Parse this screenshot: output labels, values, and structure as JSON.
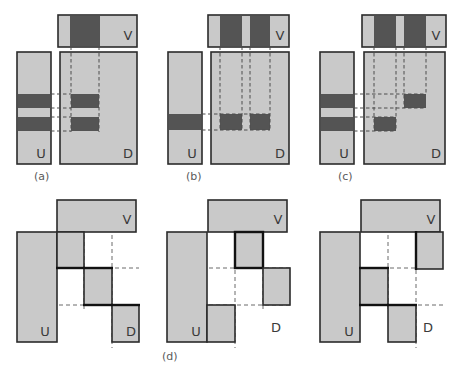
{
  "figure": {
    "title": "",
    "caption_labels": [
      {
        "id": "a",
        "text": "(a)",
        "x": 43,
        "y": 170
      },
      {
        "id": "b",
        "text": "(b)",
        "x": 188,
        "y": 170
      },
      {
        "id": "c",
        "text": "(c)",
        "x": 340,
        "y": 170
      },
      {
        "id": "d",
        "text": "(d)",
        "x": 162,
        "y": 350
      }
    ],
    "colors": {
      "light_gray": "#c9c9c9",
      "dark_gray": "#545454",
      "outline": "#2b2b2b",
      "dashed": "#4d4d4d",
      "background": "#ffffff",
      "label_text": "#4a4a4a",
      "caption_text": "#5a5a5a"
    },
    "block_labels": {
      "u": "U",
      "v": "V",
      "d": "D"
    },
    "panels": [
      {
        "id": "panel-a",
        "caption": "(a)",
        "origin": {
          "x": 0,
          "y": 0
        },
        "u_block": {
          "x": 17,
          "y": 52,
          "w": 34,
          "h": 112,
          "label": "U",
          "segments": [
            {
              "y": 94,
              "h": 14,
              "fill": "dark"
            },
            {
              "y": 108,
              "h": 9,
              "fill": "light"
            },
            {
              "y": 117,
              "h": 14,
              "fill": "dark"
            }
          ]
        },
        "v_block": {
          "x": 58,
          "y": 15,
          "w": 79,
          "h": 32,
          "label": "V",
          "segments": [
            {
              "x": 70,
              "w": 30,
              "fill": "dark"
            }
          ]
        },
        "d_block": {
          "x": 60,
          "y": 52,
          "w": 77,
          "h": 112,
          "label": "D",
          "cells": [
            {
              "x": 71,
              "y": 94,
              "w": 28,
              "h": 14,
              "fill": "dark"
            },
            {
              "x": 71,
              "y": 117,
              "w": 28,
              "h": 14,
              "fill": "dark"
            }
          ],
          "v_dashes": [
            71,
            99
          ],
          "h_dashes": [
            94,
            108,
            117,
            131
          ]
        }
      },
      {
        "id": "panel-b",
        "caption": "(b)",
        "origin": {
          "x": 150,
          "y": 0
        },
        "u_block": {
          "x": 168,
          "y": 52,
          "w": 34,
          "h": 112,
          "label": "U",
          "segments": [
            {
              "y": 114,
              "h": 16,
              "fill": "dark"
            }
          ]
        },
        "v_block": {
          "x": 208,
          "y": 15,
          "w": 81,
          "h": 32,
          "label": "V",
          "segments": [
            {
              "x": 220,
              "w": 22,
              "fill": "dark"
            },
            {
              "x": 250,
              "w": 20,
              "fill": "dark"
            }
          ]
        },
        "d_block": {
          "x": 211,
          "y": 52,
          "w": 78,
          "h": 112,
          "label": "D",
          "cells": [
            {
              "x": 220,
              "y": 114,
              "w": 22,
              "h": 16,
              "fill": "dark"
            },
            {
              "x": 250,
              "y": 114,
              "w": 20,
              "h": 16,
              "fill": "dark"
            }
          ],
          "v_dashes": [
            220,
            242,
            250,
            270
          ],
          "h_dashes": [
            114,
            130
          ]
        }
      },
      {
        "id": "panel-c",
        "caption": "(c)",
        "origin": {
          "x": 300,
          "y": 0
        },
        "u_block": {
          "x": 320,
          "y": 52,
          "w": 34,
          "h": 112,
          "label": "U",
          "segments": [
            {
              "y": 94,
              "h": 14,
              "fill": "dark"
            },
            {
              "y": 108,
              "h": 9,
              "fill": "light"
            },
            {
              "y": 117,
              "h": 14,
              "fill": "dark"
            }
          ]
        },
        "v_block": {
          "x": 362,
          "y": 15,
          "w": 84,
          "h": 32,
          "label": "V",
          "segments": [
            {
              "x": 374,
              "w": 22,
              "fill": "dark"
            },
            {
              "x": 404,
              "w": 22,
              "fill": "dark"
            }
          ]
        },
        "d_block": {
          "x": 364,
          "y": 52,
          "w": 81,
          "h": 112,
          "label": "D",
          "cells": [
            {
              "x": 404,
              "y": 94,
              "w": 22,
              "h": 14,
              "fill": "dark"
            },
            {
              "x": 374,
              "y": 117,
              "w": 22,
              "h": 14,
              "fill": "dark"
            }
          ],
          "v_dashes": [
            374,
            396,
            404,
            426
          ],
          "h_dashes": [
            94,
            108,
            117,
            131
          ]
        }
      },
      {
        "id": "panel-d1",
        "caption": "",
        "origin": {
          "x": 0,
          "y": 190
        },
        "u_block": {
          "x": 17,
          "y": 232,
          "w": 40,
          "h": 110,
          "label": "U",
          "dashes_y": [
            268,
            305
          ]
        },
        "v_block": {
          "x": 57,
          "y": 200,
          "w": 79,
          "h": 32,
          "label": "V",
          "dashes_x": [
            84,
            112
          ]
        },
        "steps": [
          {
            "x": 57,
            "y": 232,
            "w": 27,
            "h": 36,
            "bold": "bottom"
          },
          {
            "x": 84,
            "y": 268,
            "w": 28,
            "h": 37,
            "bold": "top-bottom"
          },
          {
            "x": 112,
            "y": 305,
            "w": 27,
            "h": 37,
            "bold": "top",
            "label": "D"
          }
        ],
        "dash_h": [
          268,
          305
        ],
        "dash_v": [
          84,
          112
        ]
      },
      {
        "id": "panel-d2",
        "caption": "(d)",
        "origin": {
          "x": 150,
          "y": 190
        },
        "u_block": {
          "x": 167,
          "y": 232,
          "w": 40,
          "h": 110,
          "label": "U",
          "dashes_y": [
            268,
            305
          ]
        },
        "v_block": {
          "x": 208,
          "y": 200,
          "w": 79,
          "h": 32,
          "label": "V",
          "dashes_x": [
            235,
            263
          ]
        },
        "steps": [
          {
            "x": 235,
            "y": 232,
            "w": 28,
            "h": 36,
            "bold": "all"
          },
          {
            "x": 263,
            "y": 268,
            "w": 27,
            "h": 37,
            "bold": "none",
            "label": "D"
          },
          {
            "x": 207,
            "y": 305,
            "w": 28,
            "h": 37,
            "bold": "none"
          }
        ],
        "dash_h": [
          268,
          305
        ],
        "dash_v": [
          235,
          263
        ],
        "d_label": {
          "x": 272,
          "y": 332
        }
      },
      {
        "id": "panel-d3",
        "caption": "",
        "origin": {
          "x": 300,
          "y": 190
        },
        "u_block": {
          "x": 320,
          "y": 232,
          "w": 40,
          "h": 110,
          "label": "U",
          "dashes_y": [
            268,
            305
          ]
        },
        "v_block": {
          "x": 361,
          "y": 200,
          "w": 79,
          "h": 32,
          "label": "V",
          "dashes_x": [
            388,
            416
          ]
        },
        "steps": [
          {
            "x": 416,
            "y": 232,
            "w": 27,
            "h": 37,
            "bold": "left"
          },
          {
            "x": 360,
            "y": 268,
            "w": 28,
            "h": 37,
            "bold": "top-bottom"
          },
          {
            "x": 388,
            "y": 305,
            "w": 28,
            "h": 37,
            "bold": "top"
          }
        ],
        "dash_h": [
          268,
          305
        ],
        "dash_v": [
          388,
          416
        ],
        "d_label": {
          "x": 420,
          "y": 332
        }
      }
    ]
  }
}
